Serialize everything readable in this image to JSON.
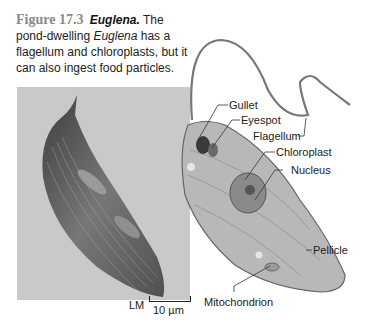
{
  "caption": {
    "figure_number": "Figure 17.3",
    "title": "Euglena.",
    "text_1": " The pond-dwelling ",
    "italic_term": "Euglena",
    "text_2": " has a flagellum and chloroplasts, but it can also ingest food particles."
  },
  "micrograph": {
    "type_label": "LM",
    "scale_label": "10 µm"
  },
  "illustration": {
    "labels": {
      "gullet": "Gullet",
      "eyespot": "Eyespot",
      "flagellum": "Flagellum",
      "chloroplast": "Chloroplast",
      "nucleus": "Nucleus",
      "pellicle": "Pellicle",
      "mitochondrion": "Mitochondrion"
    }
  },
  "colors": {
    "figure_number": "#8a8a8a",
    "photo_bg": "#c9c9c9",
    "cell_fill": "#b8b8b8"
  }
}
